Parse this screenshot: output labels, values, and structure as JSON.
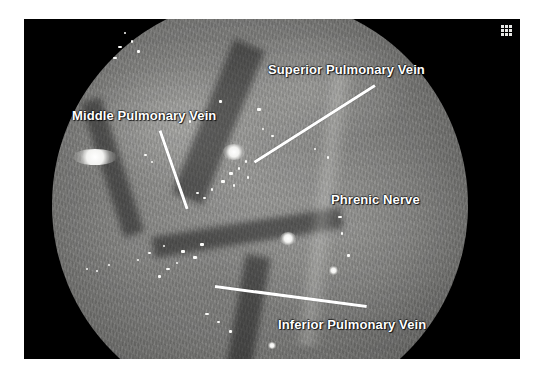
{
  "figure": {
    "kind": "thoracoscopic-endoscopic-photograph",
    "modality": "Video-Assisted Thoracoscopic Surgery (VATS)",
    "annotation_text_color": "#FFFFFF",
    "leader_line_color": "#FFFFFF",
    "frame_color": "#000000",
    "page_background": "#FFFFFF"
  },
  "annotations": [
    {
      "id": "superior-pulmonary-vein",
      "label": "Superior Pulmonary Vein",
      "label_x": 268,
      "label_y": 62,
      "leader": {
        "x1": 375,
        "y1": 84,
        "x2": 254,
        "y2": 161
      }
    },
    {
      "id": "middle-pulmonary-vein",
      "label": "Middle Pulmonary Vein",
      "label_x": 72,
      "label_y": 108,
      "leader": {
        "x1": 160,
        "y1": 129,
        "x2": 187,
        "y2": 207
      }
    },
    {
      "id": "phrenic-nerve",
      "label": "Phrenic Nerve",
      "label_x": 331,
      "label_y": 192,
      "leader": null
    },
    {
      "id": "inferior-pulmonary-vein",
      "label": "Inferior Pulmonary Vein",
      "label_x": 278,
      "label_y": 317,
      "leader": {
        "x1": 215,
        "y1": 285,
        "x2": 367,
        "y2": 305
      }
    }
  ],
  "corner_marker": {
    "icon": "grid-3x3-icon",
    "dot_count": 9,
    "color": "#E8E8E6"
  },
  "field_of_view": {
    "shape": "circle",
    "center_x": 262,
    "center_y": 205,
    "radius": 208
  },
  "highlights": [
    {
      "name": "specular-left",
      "x": 95,
      "y": 157,
      "w": 44,
      "h": 16
    },
    {
      "name": "specular-center",
      "x": 234,
      "y": 152,
      "w": 22,
      "h": 16
    },
    {
      "name": "specular-midright",
      "x": 288,
      "y": 238,
      "w": 16,
      "h": 13
    },
    {
      "name": "specular-low",
      "x": 333,
      "y": 270,
      "w": 9,
      "h": 9
    },
    {
      "name": "specular-bottom",
      "x": 272,
      "y": 345,
      "w": 8,
      "h": 7
    }
  ],
  "clips": [
    {
      "x": 124,
      "y": 32
    },
    {
      "x": 131,
      "y": 40
    },
    {
      "x": 118,
      "y": 46
    },
    {
      "x": 137,
      "y": 50
    },
    {
      "x": 113,
      "y": 57
    },
    {
      "x": 219,
      "y": 100
    },
    {
      "x": 204,
      "y": 113
    },
    {
      "x": 189,
      "y": 120
    },
    {
      "x": 257,
      "y": 108
    },
    {
      "x": 245,
      "y": 160
    },
    {
      "x": 238,
      "y": 167
    },
    {
      "x": 229,
      "y": 172
    },
    {
      "x": 247,
      "y": 176
    },
    {
      "x": 221,
      "y": 180
    },
    {
      "x": 233,
      "y": 184
    },
    {
      "x": 211,
      "y": 188
    },
    {
      "x": 196,
      "y": 192
    },
    {
      "x": 203,
      "y": 197
    },
    {
      "x": 144,
      "y": 154
    },
    {
      "x": 151,
      "y": 161
    },
    {
      "x": 163,
      "y": 245
    },
    {
      "x": 148,
      "y": 252
    },
    {
      "x": 137,
      "y": 259
    },
    {
      "x": 108,
      "y": 264
    },
    {
      "x": 96,
      "y": 270
    },
    {
      "x": 181,
      "y": 250
    },
    {
      "x": 193,
      "y": 256
    },
    {
      "x": 176,
      "y": 262
    },
    {
      "x": 166,
      "y": 268
    },
    {
      "x": 158,
      "y": 275
    },
    {
      "x": 200,
      "y": 243
    },
    {
      "x": 314,
      "y": 148
    },
    {
      "x": 327,
      "y": 156
    },
    {
      "x": 338,
      "y": 216
    },
    {
      "x": 341,
      "y": 232
    },
    {
      "x": 347,
      "y": 254
    },
    {
      "x": 205,
      "y": 313
    },
    {
      "x": 217,
      "y": 321
    },
    {
      "x": 229,
      "y": 330
    },
    {
      "x": 86,
      "y": 268
    },
    {
      "x": 262,
      "y": 128
    },
    {
      "x": 271,
      "y": 135
    }
  ]
}
